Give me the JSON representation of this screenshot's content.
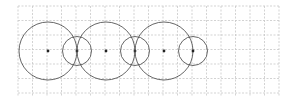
{
  "diagram": {
    "type": "circles-on-grid",
    "background": "#ffffff",
    "grid": {
      "x0": 18,
      "y0": 6,
      "x1": 279,
      "y1": 97,
      "cell": 14.5,
      "color": "#c8c8c8",
      "dashed": true
    },
    "circles": [
      {
        "cx": 48,
        "cy": 51,
        "r": 29
      },
      {
        "cx": 77,
        "cy": 51,
        "r": 14.5
      },
      {
        "cx": 106,
        "cy": 51,
        "r": 29
      },
      {
        "cx": 135,
        "cy": 51,
        "r": 14.5
      },
      {
        "cx": 164,
        "cy": 51,
        "r": 29
      },
      {
        "cx": 193,
        "cy": 51,
        "r": 14.5
      }
    ],
    "circle_color": "#555555",
    "center_dot_color": "#222222"
  }
}
